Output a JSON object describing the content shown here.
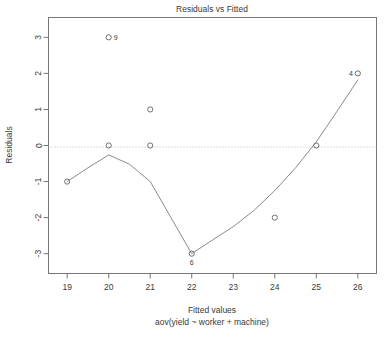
{
  "chart_data": {
    "type": "scatter",
    "title": "Residuals vs Fitted",
    "xlabel": "Fitted values",
    "sublabel": "aov(yield ~ worker + machine)",
    "ylabel": "Residuals",
    "xlim": [
      18.55,
      26.45
    ],
    "ylim": [
      -3.55,
      3.55
    ],
    "xticks": [
      "19",
      "20",
      "21",
      "22",
      "23",
      "24",
      "25",
      "26"
    ],
    "xtick_values": [
      19,
      20,
      21,
      22,
      23,
      24,
      25,
      26
    ],
    "yticks": [
      "3",
      "2",
      "1",
      "0",
      "-1",
      "-2",
      "-3"
    ],
    "ytick_values": [
      3,
      2,
      1,
      0,
      -1,
      -2,
      -3
    ],
    "grid": false,
    "legend": "none",
    "zero_reference_line": 0,
    "points": [
      {
        "x": 19,
        "y": -1,
        "label": ""
      },
      {
        "x": 20,
        "y": 3,
        "label": "9",
        "label_pos": "right"
      },
      {
        "x": 20,
        "y": 0,
        "label": ""
      },
      {
        "x": 21,
        "y": 1,
        "label": ""
      },
      {
        "x": 21,
        "y": 0,
        "label": ""
      },
      {
        "x": 22,
        "y": -3,
        "label": "6",
        "label_pos": "below"
      },
      {
        "x": 24,
        "y": -2,
        "label": ""
      },
      {
        "x": 25,
        "y": 0,
        "label": ""
      },
      {
        "x": 26,
        "y": 2,
        "label": "4",
        "label_pos": "left"
      }
    ],
    "smoother": [
      {
        "x": 19.0,
        "y": -1.0
      },
      {
        "x": 19.5,
        "y": -0.62
      },
      {
        "x": 20.0,
        "y": -0.26
      },
      {
        "x": 20.5,
        "y": -0.52
      },
      {
        "x": 21.0,
        "y": -1.0
      },
      {
        "x": 21.5,
        "y": -2.0
      },
      {
        "x": 22.0,
        "y": -3.0
      },
      {
        "x": 22.5,
        "y": -2.62
      },
      {
        "x": 23.0,
        "y": -2.25
      },
      {
        "x": 23.5,
        "y": -1.8
      },
      {
        "x": 24.0,
        "y": -1.25
      },
      {
        "x": 24.5,
        "y": -0.62
      },
      {
        "x": 25.0,
        "y": 0.1
      },
      {
        "x": 25.5,
        "y": 0.95
      },
      {
        "x": 26.0,
        "y": 1.82
      }
    ],
    "colors": {
      "frame": "#767676",
      "point": "#6f6f6f",
      "smoother": "#8a8a8a",
      "zero_line": "#b9b9b9",
      "text": "#3a3a3a",
      "background": "#ffffff"
    }
  }
}
